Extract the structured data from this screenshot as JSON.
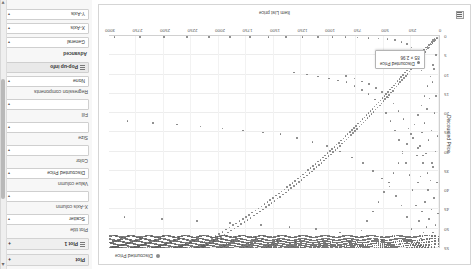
{
  "app": {
    "orientation_note": "rotated-180"
  },
  "config_panel": {
    "scroll_up_icon": "chevron-up-icon",
    "scroll_down_icon": "chevron-down-icon",
    "sections": [
      {
        "label": "Plot",
        "expander": "+"
      },
      {
        "label": "Plot 1",
        "expander": "+"
      }
    ],
    "plot_title_label": "Plot title",
    "plot_type_value": "Scatter",
    "x_axis_column_label": "X-Axis column",
    "x_axis_column_value": "",
    "value_column_label": "Value column",
    "value_column_value": "Discounted Price",
    "color_label": "Color",
    "color_value": "",
    "size_label": "Size",
    "size_value": "",
    "fill_label": "Fill",
    "fill_value": "",
    "regression_label": "Regression components",
    "regression_value": "None",
    "popup_info_label": "Pop-up info",
    "advanced_label": "Advanced",
    "general_label": "General",
    "x_axis_label": "X-Axis",
    "y_axis_label": "Y-Axis",
    "caret": "▾"
  },
  "chart_data": {
    "type": "scatter",
    "title": "",
    "xlabel": "Item List price",
    "ylabel": "Discounted Price",
    "legend": [
      {
        "name": "Discounted Price",
        "color": "#8c8c8c"
      }
    ],
    "legend_position": "top-right",
    "grid": true,
    "xlim": [
      0,
      3000
    ],
    "ylim": [
      0,
      55
    ],
    "xticks": [
      0,
      250,
      500,
      750,
      1000,
      1250,
      1500,
      1750,
      2000,
      2250,
      2500,
      2750,
      3000
    ],
    "yticks": [
      0,
      5,
      10,
      15,
      20,
      25,
      30,
      35,
      40,
      45,
      50,
      55
    ],
    "tooltip": {
      "series": "Discounted Price",
      "x": 85,
      "y": 2.96,
      "text_line1": "85 × 2.96",
      "text_line2": "Discounted Price"
    },
    "points": [
      [
        12,
        0.4
      ],
      [
        18,
        0.6
      ],
      [
        22,
        0.5
      ],
      [
        30,
        0.9
      ],
      [
        35,
        1.2
      ],
      [
        41,
        0.8
      ],
      [
        48,
        1.4
      ],
      [
        55,
        1.1
      ],
      [
        60,
        1.8
      ],
      [
        66,
        1.5
      ],
      [
        72,
        2.2
      ],
      [
        78,
        1.9
      ],
      [
        85,
        2.96
      ],
      [
        92,
        2.4
      ],
      [
        98,
        3.1
      ],
      [
        105,
        2.7
      ],
      [
        112,
        3.5
      ],
      [
        120,
        3.0
      ],
      [
        128,
        4.2
      ],
      [
        135,
        3.6
      ],
      [
        142,
        4.8
      ],
      [
        150,
        4.1
      ],
      [
        158,
        5.4
      ],
      [
        165,
        4.6
      ],
      [
        172,
        5.9
      ],
      [
        180,
        5.1
      ],
      [
        188,
        6.3
      ],
      [
        195,
        5.6
      ],
      [
        205,
        7.0
      ],
      [
        212,
        6.2
      ],
      [
        220,
        7.6
      ],
      [
        228,
        6.8
      ],
      [
        236,
        8.1
      ],
      [
        244,
        7.3
      ],
      [
        252,
        8.7
      ],
      [
        260,
        7.9
      ],
      [
        268,
        9.2
      ],
      [
        276,
        8.4
      ],
      [
        285,
        9.8
      ],
      [
        293,
        9.0
      ],
      [
        301,
        10.3
      ],
      [
        310,
        9.5
      ],
      [
        318,
        10.9
      ],
      [
        326,
        10.1
      ],
      [
        335,
        11.4
      ],
      [
        343,
        10.6
      ],
      [
        352,
        12.0
      ],
      [
        360,
        11.2
      ],
      [
        369,
        12.5
      ],
      [
        377,
        11.7
      ],
      [
        386,
        13.1
      ],
      [
        394,
        12.3
      ],
      [
        403,
        13.6
      ],
      [
        411,
        12.8
      ],
      [
        420,
        14.2
      ],
      [
        428,
        13.4
      ],
      [
        437,
        14.7
      ],
      [
        445,
        13.9
      ],
      [
        454,
        15.3
      ],
      [
        462,
        14.5
      ],
      [
        471,
        15.8
      ],
      [
        480,
        15.0
      ],
      [
        489,
        16.4
      ],
      [
        497,
        15.6
      ],
      [
        506,
        16.9
      ],
      [
        515,
        16.1
      ],
      [
        524,
        17.5
      ],
      [
        532,
        16.7
      ],
      [
        541,
        18.0
      ],
      [
        550,
        17.2
      ],
      [
        559,
        18.6
      ],
      [
        568,
        17.8
      ],
      [
        577,
        19.1
      ],
      [
        586,
        18.3
      ],
      [
        595,
        19.7
      ],
      [
        604,
        18.9
      ],
      [
        613,
        20.2
      ],
      [
        622,
        19.4
      ],
      [
        631,
        20.8
      ],
      [
        640,
        20.0
      ],
      [
        650,
        21.3
      ],
      [
        659,
        20.5
      ],
      [
        668,
        21.9
      ],
      [
        677,
        21.1
      ],
      [
        687,
        22.4
      ],
      [
        696,
        21.6
      ],
      [
        705,
        23.0
      ],
      [
        715,
        22.2
      ],
      [
        724,
        23.5
      ],
      [
        734,
        22.7
      ],
      [
        743,
        24.1
      ],
      [
        753,
        23.3
      ],
      [
        762,
        24.6
      ],
      [
        772,
        23.8
      ],
      [
        782,
        25.2
      ],
      [
        791,
        24.4
      ],
      [
        801,
        25.7
      ],
      [
        811,
        24.9
      ],
      [
        821,
        26.3
      ],
      [
        830,
        25.5
      ],
      [
        840,
        26.8
      ],
      [
        850,
        26.0
      ],
      [
        860,
        27.4
      ],
      [
        870,
        26.6
      ],
      [
        880,
        27.9
      ],
      [
        890,
        27.1
      ],
      [
        900,
        28.5
      ],
      [
        910,
        27.7
      ],
      [
        921,
        29.0
      ],
      [
        931,
        28.2
      ],
      [
        941,
        29.6
      ],
      [
        951,
        28.8
      ],
      [
        962,
        30.1
      ],
      [
        972,
        29.3
      ],
      [
        983,
        30.7
      ],
      [
        993,
        29.9
      ],
      [
        1004,
        31.2
      ],
      [
        1014,
        30.4
      ],
      [
        1025,
        31.8
      ],
      [
        1036,
        31.0
      ],
      [
        1046,
        32.3
      ],
      [
        1057,
        31.5
      ],
      [
        1068,
        32.9
      ],
      [
        1079,
        32.1
      ],
      [
        1090,
        33.4
      ],
      [
        1101,
        32.6
      ],
      [
        1112,
        34.0
      ],
      [
        1123,
        33.2
      ],
      [
        1134,
        34.5
      ],
      [
        1145,
        33.7
      ],
      [
        1157,
        35.1
      ],
      [
        1168,
        34.3
      ],
      [
        1179,
        35.6
      ],
      [
        1191,
        34.8
      ],
      [
        1202,
        36.2
      ],
      [
        1214,
        35.4
      ],
      [
        1225,
        36.7
      ],
      [
        1237,
        35.9
      ],
      [
        1249,
        37.3
      ],
      [
        1260,
        36.5
      ],
      [
        1272,
        37.8
      ],
      [
        1284,
        37.0
      ],
      [
        1296,
        38.4
      ],
      [
        1308,
        37.6
      ],
      [
        1320,
        38.9
      ],
      [
        1332,
        38.1
      ],
      [
        1344,
        39.5
      ],
      [
        1356,
        38.7
      ],
      [
        1369,
        40.0
      ],
      [
        1381,
        39.2
      ],
      [
        1393,
        40.6
      ],
      [
        1406,
        39.8
      ],
      [
        1418,
        41.1
      ],
      [
        1431,
        40.3
      ],
      [
        1443,
        41.7
      ],
      [
        1456,
        40.9
      ],
      [
        1469,
        42.2
      ],
      [
        1482,
        41.4
      ],
      [
        1495,
        42.8
      ],
      [
        1508,
        42.0
      ],
      [
        1521,
        43.3
      ],
      [
        1534,
        42.5
      ],
      [
        1547,
        43.9
      ],
      [
        1560,
        43.1
      ],
      [
        1574,
        44.4
      ],
      [
        1587,
        43.6
      ],
      [
        1601,
        45.0
      ],
      [
        1614,
        44.2
      ],
      [
        1628,
        45.5
      ],
      [
        1642,
        44.7
      ],
      [
        1656,
        46.1
      ],
      [
        1670,
        45.3
      ],
      [
        1684,
        46.6
      ],
      [
        1698,
        45.8
      ],
      [
        1712,
        47.2
      ],
      [
        1726,
        46.4
      ],
      [
        1741,
        47.7
      ],
      [
        1755,
        46.9
      ],
      [
        1770,
        48.3
      ],
      [
        1784,
        47.5
      ],
      [
        1799,
        48.8
      ],
      [
        1814,
        48.0
      ],
      [
        1829,
        49.4
      ],
      [
        1844,
        48.6
      ],
      [
        1859,
        49.9
      ],
      [
        1874,
        49.1
      ],
      [
        1889,
        50.5
      ],
      [
        1905,
        49.7
      ],
      [
        1920,
        51.0
      ],
      [
        1936,
        50.2
      ],
      [
        1951,
        51.6
      ],
      [
        1967,
        50.8
      ],
      [
        1983,
        52.1
      ],
      [
        1999,
        51.3
      ],
      [
        2015,
        52.7
      ],
      [
        2031,
        51.9
      ],
      [
        2047,
        53.2
      ],
      [
        2064,
        52.4
      ],
      [
        2080,
        53.8
      ],
      [
        2097,
        53.0
      ],
      [
        2113,
        54.3
      ],
      [
        2130,
        53.5
      ],
      [
        2147,
        54.9
      ],
      [
        2164,
        54.1
      ],
      [
        2181,
        55.0
      ],
      [
        2198,
        54.7
      ],
      [
        2216,
        55.0
      ],
      [
        2233,
        55.0
      ],
      [
        2251,
        55.0
      ],
      [
        2268,
        55.0
      ],
      [
        2286,
        55.0
      ],
      [
        2304,
        55.0
      ],
      [
        2322,
        55.0
      ],
      [
        2340,
        55.0
      ],
      [
        2359,
        55.0
      ],
      [
        2377,
        55.0
      ],
      [
        2396,
        55.0
      ],
      [
        2414,
        55.0
      ],
      [
        2433,
        55.0
      ],
      [
        2452,
        55.0
      ],
      [
        2471,
        55.0
      ],
      [
        2491,
        55.0
      ],
      [
        2510,
        55.0
      ],
      [
        2530,
        55.0
      ],
      [
        2549,
        55.0
      ],
      [
        2569,
        55.0
      ],
      [
        2589,
        55.0
      ],
      [
        2609,
        55.0
      ],
      [
        2630,
        55.0
      ],
      [
        2650,
        55.0
      ],
      [
        2671,
        55.0
      ],
      [
        2692,
        55.0
      ],
      [
        2713,
        55.0
      ],
      [
        2734,
        55.0
      ],
      [
        2755,
        55.0
      ],
      [
        2777,
        55.0
      ],
      [
        2799,
        55.0
      ],
      [
        2821,
        55.0
      ],
      [
        2843,
        55.0
      ],
      [
        2865,
        55.0
      ],
      [
        2888,
        55.0
      ],
      [
        2911,
        55.0
      ],
      [
        2934,
        55.0
      ],
      [
        2957,
        55.0
      ],
      [
        2980,
        55.0
      ],
      [
        3000,
        55.0
      ],
      [
        45,
        8.5
      ],
      [
        60,
        12.0
      ],
      [
        88,
        16.2
      ],
      [
        110,
        19.0
      ],
      [
        130,
        22.5
      ],
      [
        155,
        25.0
      ],
      [
        175,
        28.5
      ],
      [
        200,
        31.0
      ],
      [
        25,
        15.5
      ],
      [
        40,
        20.0
      ],
      [
        70,
        24.5
      ],
      [
        95,
        27.0
      ],
      [
        120,
        30.5
      ],
      [
        145,
        33.0
      ],
      [
        168,
        36.5
      ],
      [
        190,
        38.0
      ],
      [
        15,
        26.0
      ],
      [
        33,
        30.0
      ],
      [
        52,
        34.0
      ],
      [
        76,
        37.5
      ],
      [
        100,
        40.0
      ],
      [
        128,
        43.0
      ],
      [
        152,
        45.5
      ],
      [
        180,
        48.0
      ],
      [
        20,
        38.0
      ],
      [
        44,
        42.0
      ],
      [
        68,
        45.0
      ],
      [
        90,
        47.5
      ],
      [
        115,
        49.5
      ],
      [
        140,
        51.0
      ],
      [
        165,
        52.5
      ],
      [
        195,
        53.5
      ],
      [
        10,
        46.0
      ],
      [
        30,
        49.0
      ],
      [
        55,
        51.0
      ],
      [
        80,
        52.5
      ],
      [
        210,
        44.0
      ],
      [
        240,
        40.0
      ],
      [
        270,
        36.0
      ],
      [
        300,
        33.0
      ],
      [
        330,
        30.0
      ],
      [
        365,
        27.0
      ],
      [
        400,
        24.5
      ],
      [
        440,
        22.0
      ],
      [
        480,
        20.0
      ],
      [
        530,
        18.0
      ],
      [
        580,
        16.5
      ],
      [
        640,
        15.0
      ],
      [
        700,
        14.0
      ],
      [
        770,
        13.0
      ],
      [
        840,
        12.0
      ],
      [
        920,
        11.5
      ],
      [
        1000,
        11.0
      ],
      [
        1100,
        10.5
      ],
      [
        1200,
        10.0
      ],
      [
        1320,
        9.5
      ],
      [
        250,
        50.0
      ],
      [
        290,
        47.0
      ],
      [
        340,
        44.0
      ],
      [
        390,
        41.5
      ],
      [
        450,
        39.0
      ],
      [
        520,
        37.0
      ],
      [
        600,
        35.0
      ],
      [
        690,
        33.0
      ],
      [
        790,
        31.5
      ],
      [
        900,
        30.0
      ],
      [
        1020,
        28.5
      ],
      [
        1150,
        27.5
      ],
      [
        1290,
        26.5
      ],
      [
        1440,
        25.5
      ],
      [
        1600,
        25.0
      ],
      [
        1780,
        24.5
      ],
      [
        1970,
        24.0
      ],
      [
        2170,
        23.5
      ],
      [
        2380,
        23.0
      ],
      [
        2600,
        22.5
      ],
      [
        2830,
        22.0
      ],
      [
        360,
        54.0
      ],
      [
        520,
        53.0
      ],
      [
        700,
        52.0
      ],
      [
        900,
        51.0
      ],
      [
        1120,
        50.0
      ],
      [
        1360,
        49.5
      ],
      [
        1620,
        49.0
      ],
      [
        1900,
        48.5
      ],
      [
        2200,
        48.0
      ],
      [
        2520,
        47.5
      ],
      [
        2860,
        47.0
      ],
      [
        160,
        9.0
      ],
      [
        185,
        6.5
      ],
      [
        215,
        4.5
      ],
      [
        250,
        3.0
      ],
      [
        290,
        2.0
      ],
      [
        340,
        1.5
      ],
      [
        400,
        1.0
      ],
      [
        470,
        0.8
      ],
      [
        550,
        0.6
      ],
      [
        640,
        0.5
      ],
      [
        740,
        0.4
      ],
      [
        850,
        0.3
      ],
      [
        970,
        0.3
      ],
      [
        1100,
        0.2
      ],
      [
        1240,
        0.2
      ],
      [
        1390,
        0.2
      ],
      [
        1550,
        0.2
      ],
      [
        1720,
        0.2
      ],
      [
        1900,
        0.2
      ],
      [
        2090,
        0.2
      ],
      [
        2290,
        0.2
      ],
      [
        2500,
        0.2
      ],
      [
        2720,
        0.2
      ],
      [
        2950,
        0.2
      ],
      [
        62,
        33.0
      ],
      [
        105,
        35.5
      ],
      [
        148,
        31.0
      ],
      [
        192,
        29.0
      ],
      [
        235,
        26.5
      ],
      [
        278,
        24.0
      ],
      [
        322,
        21.5
      ],
      [
        368,
        19.5
      ],
      [
        415,
        17.5
      ],
      [
        465,
        16.0
      ],
      [
        518,
        14.5
      ],
      [
        575,
        13.5
      ],
      [
        635,
        12.5
      ],
      [
        700,
        11.8
      ],
      [
        770,
        11.0
      ],
      [
        845,
        10.4
      ],
      [
        28,
        5.0
      ],
      [
        52,
        7.5
      ],
      [
        78,
        10.5
      ],
      [
        104,
        13.0
      ],
      [
        132,
        15.5
      ],
      [
        160,
        18.0
      ],
      [
        190,
        20.5
      ],
      [
        222,
        23.0
      ],
      [
        256,
        25.5
      ],
      [
        292,
        28.0
      ],
      [
        330,
        30.5
      ],
      [
        370,
        33.0
      ],
      [
        412,
        35.5
      ],
      [
        456,
        38.0
      ],
      [
        502,
        40.5
      ],
      [
        550,
        43.0
      ],
      [
        600,
        45.5
      ],
      [
        652,
        48.0
      ],
      [
        706,
        50.5
      ],
      [
        762,
        52.0
      ],
      [
        820,
        53.5
      ]
    ],
    "dense_band": {
      "note": "heavy horizontal band of overlapping markers across the upper rows",
      "y_levels": [
        52.0,
        52.8,
        53.4,
        54.0,
        54.5,
        55.0
      ],
      "x_from": 0,
      "x_to": 3000
    }
  }
}
